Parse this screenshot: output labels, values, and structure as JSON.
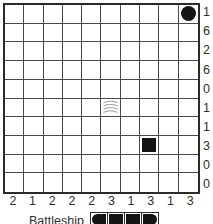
{
  "puzzle": {
    "type": "battleship-solitaire",
    "rows": 10,
    "cols": 10,
    "row_clues": [
      1,
      6,
      2,
      6,
      0,
      1,
      1,
      3,
      0,
      0
    ],
    "col_clues": [
      2,
      1,
      2,
      2,
      2,
      3,
      1,
      3,
      1,
      3
    ],
    "givens": [
      {
        "row": 1,
        "col": 10,
        "piece": "submarine"
      },
      {
        "row": 6,
        "col": 6,
        "piece": "water"
      },
      {
        "row": 8,
        "col": 8,
        "piece": "ship-middle"
      }
    ]
  },
  "caption": {
    "label": "Battleship",
    "logo_segments": [
      "left-end",
      "middle",
      "middle",
      "right-end"
    ]
  },
  "colors": {
    "grid_border": "#2b2b2b",
    "grid_line": "#4a4a4a",
    "piece": "#151515",
    "water": "#9a9a9a",
    "clue_text": "#2f2f2f",
    "background": "#ffffff"
  }
}
